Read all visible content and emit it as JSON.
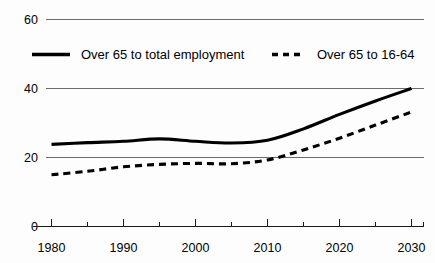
{
  "chart_data": {
    "type": "line",
    "title": "",
    "xlabel": "",
    "ylabel": "",
    "xlim": [
      1980,
      2030
    ],
    "ylim": [
      0,
      60
    ],
    "grid": true,
    "gridlines": [
      20,
      40,
      60
    ],
    "legend_position": "top-inside",
    "x_tick_labels": [
      "1980",
      "1990",
      "2000",
      "2010",
      "2020",
      "2030"
    ],
    "x_tick_label_values": [
      1980,
      1990,
      2000,
      2010,
      2020,
      2030
    ],
    "x_minor_ticks": [
      1980,
      1985,
      1990,
      1995,
      2000,
      2005,
      2010,
      2015,
      2020,
      2025,
      2030
    ],
    "y_tick_labels": [
      "0",
      "20",
      "40",
      "60"
    ],
    "y_tick_values": [
      0,
      20,
      40,
      60
    ],
    "x": [
      1980,
      1985,
      1990,
      1995,
      2000,
      2005,
      2010,
      2015,
      2020,
      2025,
      2030
    ],
    "series": [
      {
        "name": "Over 65 to total employment",
        "style": "solid",
        "values": [
          23.8,
          24.3,
          24.7,
          25.4,
          24.7,
          24.2,
          25.0,
          28.3,
          32.5,
          36.4,
          40.0
        ]
      },
      {
        "name": "Over 65 to 16-64",
        "style": "dashed",
        "values": [
          15.0,
          16.0,
          17.3,
          18.0,
          18.3,
          18.2,
          19.3,
          22.2,
          25.6,
          29.4,
          33.2
        ]
      }
    ]
  },
  "legend": {
    "items": [
      {
        "label": "Over 65 to total employment",
        "style": "solid"
      },
      {
        "label": "Over 65 to 16-64",
        "style": "dashed"
      }
    ]
  },
  "axes": {
    "y_labels": [
      "60",
      "40",
      "20",
      "0"
    ],
    "x_labels": [
      "1980",
      "1990",
      "2000",
      "2010",
      "2020",
      "2030"
    ]
  },
  "colors": {
    "series": "#000000",
    "gridline": "#6b6b6b",
    "axis": "#1a1a1a",
    "background": "#fdfdfd"
  }
}
